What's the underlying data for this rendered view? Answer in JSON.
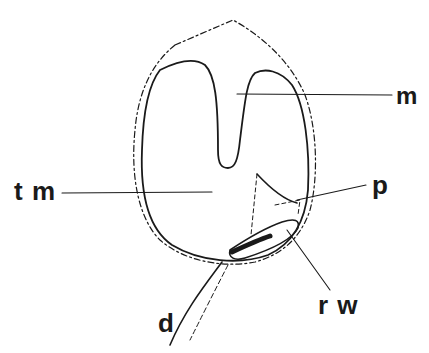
{
  "figure": {
    "type": "anatomical line drawing",
    "labels": [
      {
        "id": "m",
        "text": "m"
      },
      {
        "id": "tm",
        "text": "t m"
      },
      {
        "id": "p",
        "text": "p"
      },
      {
        "id": "rw",
        "text": "r w"
      },
      {
        "id": "d",
        "text": "d"
      }
    ],
    "colors": {
      "ink": "#1a1a1a",
      "background": "#ffffff"
    }
  }
}
